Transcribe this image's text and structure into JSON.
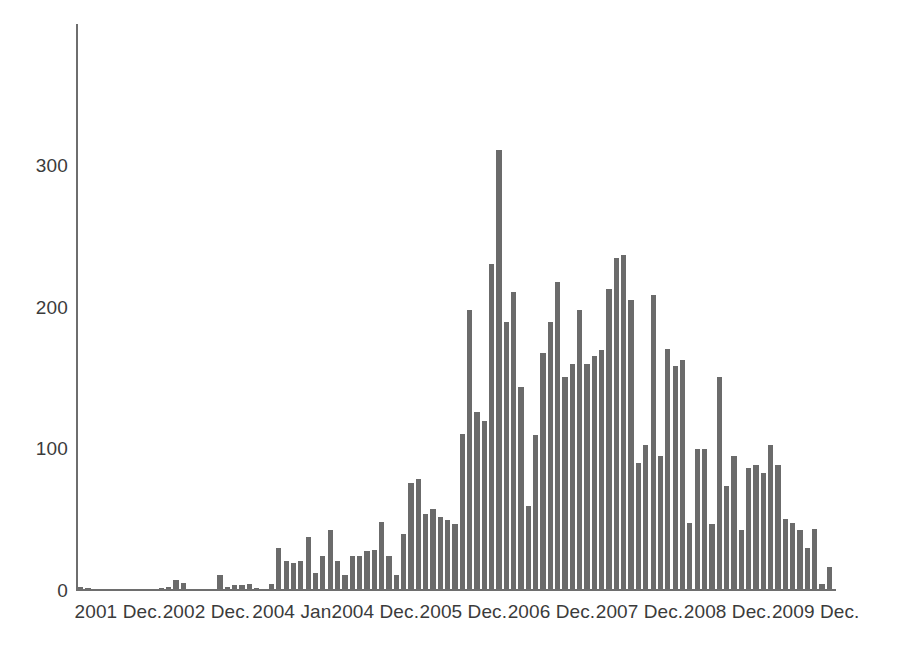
{
  "chart_data": {
    "type": "bar",
    "title": "",
    "subtitle": "",
    "xlabel": "",
    "ylabel": "",
    "xlim": [
      0,
      103
    ],
    "ylim": [
      0,
      400
    ],
    "grid": false,
    "legend": null,
    "bar_color": "#6b6b6b",
    "axis_color": "#6e6e6e",
    "text_color": "#3b3b3b",
    "y_ticks": [
      0,
      100,
      200,
      300
    ],
    "y_tick_labels": [
      "0",
      "100",
      "200",
      "300"
    ],
    "x_tick_labels": [
      "2001 Dec.",
      "2002 Dec.",
      "2004 Jan.",
      "2004 Dec.",
      "2005 Dec.",
      "2006 Dec.",
      "2007 Dec.",
      "2008 Dec.",
      "2009 Dec."
    ],
    "x_tick_indices": [
      5,
      17,
      29,
      40,
      52,
      64,
      76,
      88,
      100
    ],
    "categories": [
      "1",
      "2",
      "3",
      "4",
      "5",
      "6",
      "7",
      "8",
      "9",
      "10",
      "11",
      "12",
      "13",
      "14",
      "15",
      "16",
      "17",
      "18",
      "19",
      "20",
      "21",
      "22",
      "23",
      "24",
      "25",
      "26",
      "27",
      "28",
      "29",
      "30",
      "31",
      "32",
      "33",
      "34",
      "35",
      "36",
      "37",
      "38",
      "39",
      "40",
      "41",
      "42",
      "43",
      "44",
      "45",
      "46",
      "47",
      "48",
      "49",
      "50",
      "51",
      "52",
      "53",
      "54",
      "55",
      "56",
      "57",
      "58",
      "59",
      "60",
      "61",
      "62",
      "63",
      "64",
      "65",
      "66",
      "67",
      "68",
      "69",
      "70",
      "71",
      "72",
      "73",
      "74",
      "75",
      "76",
      "77",
      "78",
      "79",
      "80",
      "81",
      "82",
      "83",
      "84",
      "85",
      "86",
      "87",
      "88",
      "89",
      "90",
      "91",
      "92",
      "93",
      "94",
      "95",
      "96",
      "97",
      "98",
      "99",
      "100",
      "101",
      "102",
      "103"
    ],
    "values": [
      3,
      2,
      1,
      1,
      1,
      1,
      1,
      1,
      0,
      0,
      0,
      2,
      3,
      8,
      6,
      1,
      1,
      0,
      0,
      11,
      3,
      4,
      4,
      5,
      2,
      1,
      5,
      30,
      21,
      20,
      21,
      38,
      13,
      25,
      43,
      21,
      11,
      25,
      25,
      28,
      29,
      49,
      25,
      11,
      40,
      76,
      79,
      54,
      58,
      52,
      50,
      47,
      111,
      198,
      126,
      120,
      231,
      311,
      190,
      211,
      144,
      60,
      110,
      168,
      190,
      218,
      151,
      160,
      198,
      160,
      166,
      170,
      213,
      235,
      237,
      205,
      90,
      103,
      209,
      95,
      171,
      159,
      163,
      48,
      100,
      100,
      47,
      151,
      74,
      95,
      43,
      87,
      89,
      83,
      103,
      89,
      51,
      48,
      43,
      30,
      44,
      5,
      17
    ]
  }
}
